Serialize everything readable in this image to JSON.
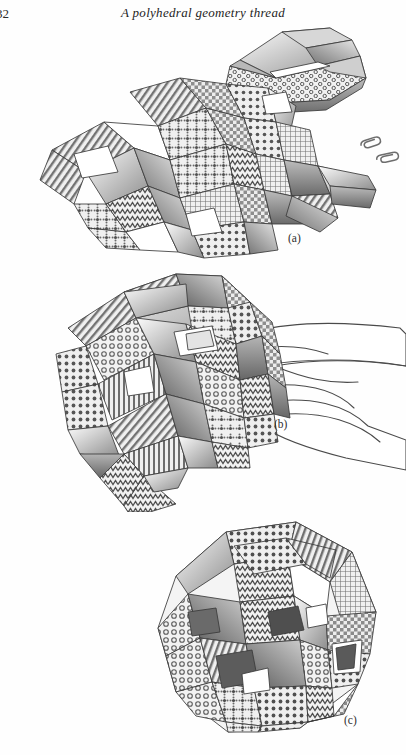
{
  "page": {
    "folio": "32",
    "running_title": "A polyhedral geometry thread",
    "background_color": "#ffffff",
    "ink_color": "#2b2b2b"
  },
  "figures": [
    {
      "id": "a",
      "label": "(a)",
      "caption_text": "(a)",
      "description": "Loose assembly of modular origami units with patterned paper faces, partly joined, with two paper clips at the right and a separate finished module at the upper right.",
      "elements": [
        "polyhedral-module-cluster",
        "detached-module",
        "paper-clip",
        "paper-clip"
      ]
    },
    {
      "id": "b",
      "label": "(b)",
      "caption_text": "(b)",
      "description": "Partially closed polyhedron held in a hand, drawn as outline; one long zigzag-patterned flap hangs down to the lower left.",
      "elements": [
        "polyhedral-module-cluster",
        "hand-outline",
        "hanging-flap"
      ]
    },
    {
      "id": "c",
      "label": "(c)",
      "caption_text": "(c)",
      "description": "Completed closed polyhedron assembled from the patterned modules, with triangular openings revealing dark interior faces.",
      "elements": [
        "completed-polyhedron"
      ]
    }
  ],
  "patterns": {
    "names": [
      "checkerboard",
      "polka-dot",
      "zigzag",
      "diagonal-hatch",
      "honeycomb",
      "small-grid",
      "floral-dot"
    ],
    "palette": {
      "paper_light": "#f2f2f2",
      "paper_mid": "#c9c9c9",
      "paper_shade": "#9a9a9a",
      "paper_dark": "#6e6e6e",
      "interior_dark": "#4a4a4a",
      "outline": "#3a3a3a"
    }
  }
}
